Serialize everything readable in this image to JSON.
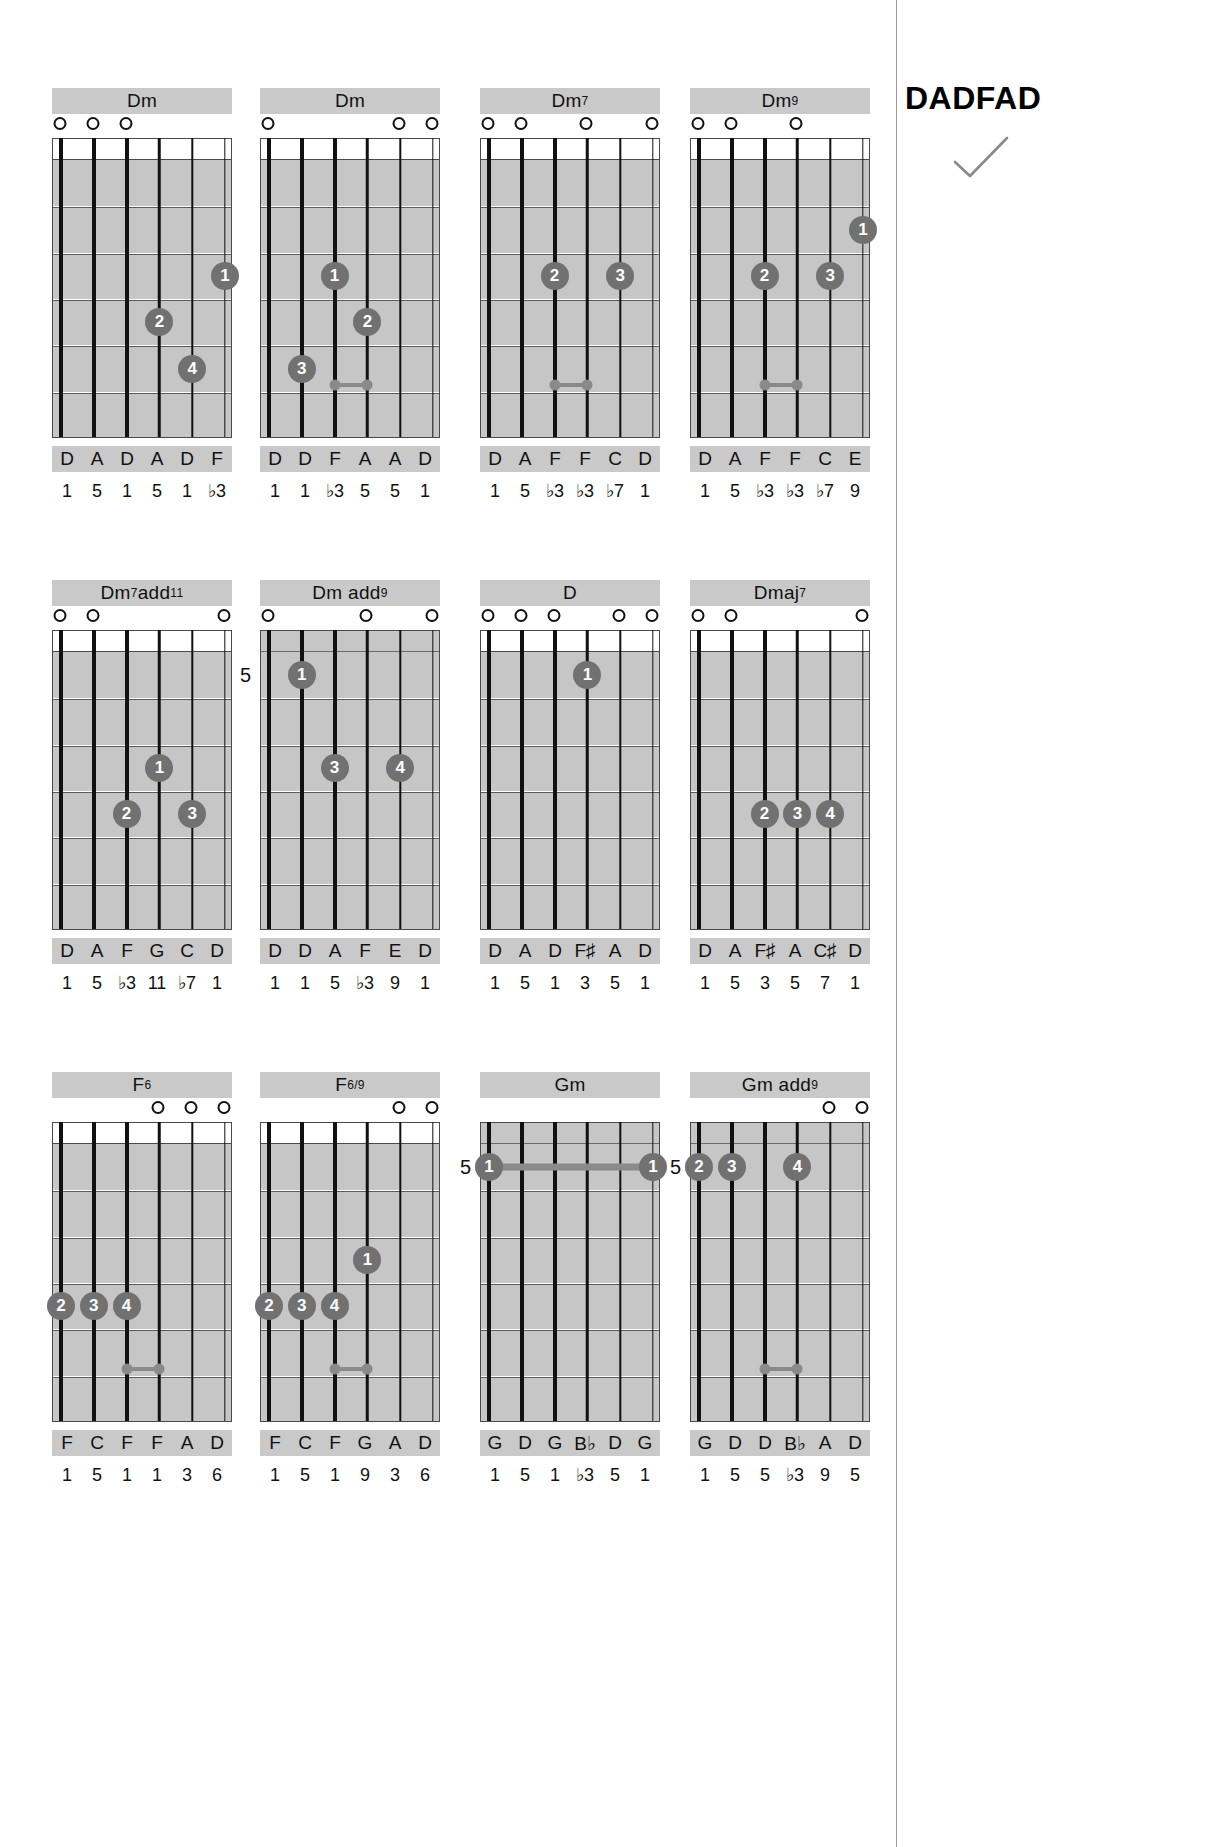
{
  "tuning": {
    "label": "DADFAD",
    "check_icon": "checkmark-icon"
  },
  "chart_data": {
    "type": "table",
    "title": "DADFAD",
    "strings": 6,
    "frets": 6,
    "chords": [
      {
        "name": "Dm",
        "name_base": "Dm",
        "name_sup": "",
        "start_fret": null,
        "open_strings": [
          1,
          2,
          3
        ],
        "fingers": [
          {
            "string": 6,
            "fret": 3,
            "finger": "1"
          },
          {
            "string": 4,
            "fret": 4,
            "finger": "2"
          },
          {
            "string": 5,
            "fret": 5,
            "finger": "4"
          }
        ],
        "notes": [
          "D",
          "A",
          "D",
          "A",
          "D",
          "F"
        ],
        "intervals": [
          "1",
          "5",
          "1",
          "5",
          "1",
          "♭3"
        ]
      },
      {
        "name": "Dm",
        "name_base": "Dm",
        "name_sup": "",
        "start_fret": null,
        "open_strings": [
          1,
          5,
          6
        ],
        "fingers": [
          {
            "string": 3,
            "fret": 3,
            "finger": "1"
          },
          {
            "string": 4,
            "fret": 4,
            "finger": "2"
          },
          {
            "string": 2,
            "fret": 5,
            "finger": "3"
          }
        ],
        "notes": [
          "D",
          "D",
          "F",
          "A",
          "A",
          "D"
        ],
        "intervals": [
          "1",
          "1",
          "♭3",
          "5",
          "5",
          "1"
        ]
      },
      {
        "name": "Dm7",
        "name_base": "Dm",
        "name_sup": "7",
        "start_fret": null,
        "open_strings": [
          1,
          2,
          4,
          6
        ],
        "fingers": [
          {
            "string": 3,
            "fret": 3,
            "finger": "2"
          },
          {
            "string": 5,
            "fret": 3,
            "finger": "3"
          }
        ],
        "notes": [
          "D",
          "A",
          "F",
          "F",
          "C",
          "D"
        ],
        "intervals": [
          "1",
          "5",
          "♭3",
          "♭3",
          "♭7",
          "1"
        ]
      },
      {
        "name": "Dm9",
        "name_base": "Dm",
        "name_sup": "9",
        "start_fret": null,
        "open_strings": [
          1,
          2,
          4
        ],
        "fingers": [
          {
            "string": 6,
            "fret": 2,
            "finger": "1"
          },
          {
            "string": 3,
            "fret": 3,
            "finger": "2"
          },
          {
            "string": 5,
            "fret": 3,
            "finger": "3"
          }
        ],
        "notes": [
          "D",
          "A",
          "F",
          "F",
          "C",
          "E"
        ],
        "intervals": [
          "1",
          "5",
          "♭3",
          "♭3",
          "♭7",
          "9"
        ]
      },
      {
        "name": "Dm7add11",
        "name_base": "Dm",
        "name_sup": "7",
        "name_tail": "add",
        "name_sup2": "11",
        "start_fret": null,
        "open_strings": [
          1,
          2,
          6
        ],
        "fingers": [
          {
            "string": 4,
            "fret": 3,
            "finger": "1"
          },
          {
            "string": 3,
            "fret": 4,
            "finger": "2"
          },
          {
            "string": 5,
            "fret": 4,
            "finger": "3"
          }
        ],
        "notes": [
          "D",
          "A",
          "F",
          "G",
          "C",
          "D"
        ],
        "intervals": [
          "1",
          "5",
          "♭3",
          "11",
          "♭7",
          "1"
        ]
      },
      {
        "name": "Dm add9",
        "name_base": "Dm add",
        "name_sup": "9",
        "start_fret": "5",
        "open_strings": [
          1,
          4,
          6
        ],
        "fingers": [
          {
            "string": 2,
            "fret": 1,
            "finger": "1"
          },
          {
            "string": 3,
            "fret": 3,
            "finger": "3"
          },
          {
            "string": 5,
            "fret": 3,
            "finger": "4"
          }
        ],
        "notes": [
          "D",
          "D",
          "A",
          "F",
          "E",
          "D"
        ],
        "intervals": [
          "1",
          "1",
          "5",
          "♭3",
          "9",
          "1"
        ]
      },
      {
        "name": "D",
        "name_base": "D",
        "name_sup": "",
        "start_fret": null,
        "open_strings": [
          1,
          2,
          3,
          5,
          6
        ],
        "fingers": [
          {
            "string": 4,
            "fret": 1,
            "finger": "1"
          }
        ],
        "notes": [
          "D",
          "A",
          "D",
          "F♯",
          "A",
          "D"
        ],
        "intervals": [
          "1",
          "5",
          "1",
          "3",
          "5",
          "1"
        ]
      },
      {
        "name": "Dmaj7",
        "name_base": "Dmaj",
        "name_sup": "7",
        "start_fret": null,
        "open_strings": [
          1,
          2,
          6
        ],
        "fingers": [
          {
            "string": 3,
            "fret": 4,
            "finger": "2"
          },
          {
            "string": 4,
            "fret": 4,
            "finger": "3"
          },
          {
            "string": 5,
            "fret": 4,
            "finger": "4"
          }
        ],
        "notes": [
          "D",
          "A",
          "F♯",
          "A",
          "C♯",
          "D"
        ],
        "intervals": [
          "1",
          "5",
          "3",
          "5",
          "7",
          "1"
        ]
      },
      {
        "name": "F6",
        "name_base": "F",
        "name_sup": "6",
        "start_fret": null,
        "open_strings": [
          4,
          5,
          6
        ],
        "fingers": [
          {
            "string": 1,
            "fret": 4,
            "finger": "2"
          },
          {
            "string": 2,
            "fret": 4,
            "finger": "3"
          },
          {
            "string": 3,
            "fret": 4,
            "finger": "4"
          }
        ],
        "notes": [
          "F",
          "C",
          "F",
          "F",
          "A",
          "D"
        ],
        "intervals": [
          "1",
          "5",
          "1",
          "1",
          "3",
          "6"
        ]
      },
      {
        "name": "F6/9",
        "name_base": "F",
        "name_sup": "6/9",
        "start_fret": null,
        "open_strings": [
          5,
          6
        ],
        "fingers": [
          {
            "string": 4,
            "fret": 3,
            "finger": "1"
          },
          {
            "string": 1,
            "fret": 4,
            "finger": "2"
          },
          {
            "string": 2,
            "fret": 4,
            "finger": "3"
          },
          {
            "string": 3,
            "fret": 4,
            "finger": "4"
          }
        ],
        "notes": [
          "F",
          "C",
          "F",
          "G",
          "A",
          "D"
        ],
        "intervals": [
          "1",
          "5",
          "1",
          "9",
          "3",
          "6"
        ]
      },
      {
        "name": "Gm",
        "name_base": "Gm",
        "name_sup": "",
        "start_fret": "5",
        "open_strings": [],
        "fingers": [
          {
            "string": 1,
            "fret": 1,
            "finger": "1"
          },
          {
            "string": 6,
            "fret": 1,
            "finger": "1"
          }
        ],
        "barre": {
          "fret": 1,
          "from_string": 1,
          "to_string": 6
        },
        "notes": [
          "G",
          "D",
          "G",
          "B♭",
          "D",
          "G"
        ],
        "intervals": [
          "1",
          "5",
          "1",
          "♭3",
          "5",
          "1"
        ]
      },
      {
        "name": "Gm add9",
        "name_base": "Gm add",
        "name_sup": "9",
        "start_fret": "5",
        "open_strings": [
          5,
          6
        ],
        "fingers": [
          {
            "string": 1,
            "fret": 1,
            "finger": "2"
          },
          {
            "string": 2,
            "fret": 1,
            "finger": "3"
          },
          {
            "string": 4,
            "fret": 1,
            "finger": "4"
          }
        ],
        "notes": [
          "G",
          "D",
          "D",
          "B♭",
          "A",
          "D"
        ],
        "intervals": [
          "1",
          "5",
          "5",
          "♭3",
          "9",
          "5"
        ]
      }
    ]
  }
}
